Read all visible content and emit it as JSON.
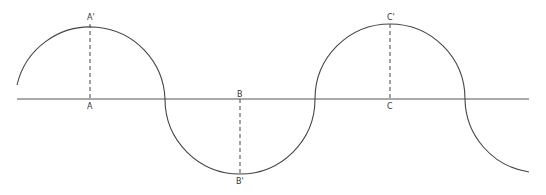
{
  "diagram": {
    "type": "wave-of-semicircles",
    "stroke_color": "#444444",
    "axis": {
      "y": 99,
      "x_start": 17,
      "x_end": 529
    },
    "points": [
      {
        "id": "A",
        "label": "A",
        "x": 90,
        "label_y": 108
      },
      {
        "id": "A_prime",
        "label": "A'",
        "x": 90,
        "label_y": 20
      },
      {
        "id": "B",
        "label": "B",
        "x": 240,
        "label_y": 97
      },
      {
        "id": "B_prime",
        "label": "B'",
        "x": 240,
        "label_y": 184
      },
      {
        "id": "C",
        "label": "C",
        "x": 390,
        "label_y": 108
      },
      {
        "id": "C_prime",
        "label": "C'",
        "x": 390,
        "label_y": 20
      }
    ],
    "labels": {
      "a": "A",
      "a_prime": "A'",
      "b": "B",
      "b_prime": "B'",
      "c": "C",
      "c_prime": "C'"
    }
  }
}
